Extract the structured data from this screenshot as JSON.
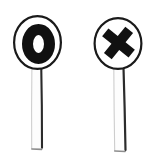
{
  "scene": {
    "title": "Hand-drawn O and X sign paddles",
    "background_color": "#ffffff",
    "ink_color": "#1a1a1a",
    "paddle_face_color": "#ffffff",
    "width": 159,
    "height": 160
  },
  "signs": [
    {
      "id": "sign-o",
      "symbol": "O",
      "symbol_name": "circle-symbol",
      "meaning": "correct",
      "disc": {
        "center_x": 37.5,
        "center_y": 42.5,
        "radius_x": 24.5,
        "radius_y": 27.5,
        "outline_color": "#1a1a1a",
        "outline_width": 2.2,
        "fill_color": "#ffffff"
      },
      "mark": {
        "center_x": 38.5,
        "center_y": 44,
        "radius_x": 16.5,
        "radius_y": 20,
        "stroke_width": 11,
        "color": "#111111"
      },
      "post": {
        "top_y": 66,
        "bottom_y": 150,
        "left_x": 31,
        "right_x": 42,
        "fill_color": "#fdfdfd",
        "outline_color": "#2b2b2b"
      }
    },
    {
      "id": "sign-x",
      "symbol": "X",
      "symbol_name": "cross-symbol",
      "meaning": "incorrect",
      "disc": {
        "center_x": 118,
        "center_y": 43.5,
        "radius_x": 24.5,
        "radius_y": 26.5,
        "outline_color": "#1a1a1a",
        "outline_width": 2.2,
        "fill_color": "#ffffff"
      },
      "mark": {
        "center_x": 118.5,
        "center_y": 43,
        "arm_length": 17,
        "stroke_width": 10,
        "tilt_degrees": -6,
        "color": "#111111"
      },
      "post": {
        "top_y": 66,
        "bottom_y": 152,
        "left_x": 113,
        "right_x": 126,
        "fill_color": "#fdfdfd",
        "outline_color": "#2b2b2b"
      }
    }
  ]
}
